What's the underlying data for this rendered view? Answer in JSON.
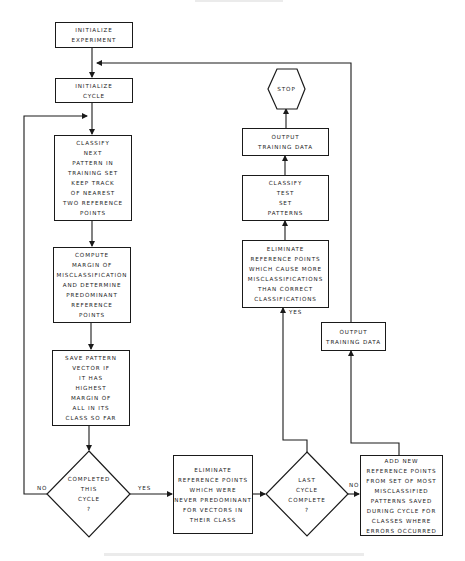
{
  "diagram": {
    "type": "flowchart",
    "header_text": "",
    "caption": "",
    "nodes": {
      "init_experiment": {
        "shape": "process",
        "lines": [
          "INITIALIZE",
          "EXPERIMENT"
        ]
      },
      "init_cycle": {
        "shape": "process",
        "lines": [
          "INITIALIZE",
          "CYCLE"
        ]
      },
      "classify_next": {
        "shape": "process",
        "lines": [
          "CLASSIFY",
          "NEXT",
          "PATTERN IN",
          "TRAINING SET",
          "KEEP TRACK",
          "OF NEAREST",
          "TWO REFERENCE",
          "POINTS"
        ]
      },
      "compute_margin": {
        "shape": "process",
        "lines": [
          "COMPUTE",
          "MARGIN OF",
          "MISCLASSIFICATION",
          "AND DETERMINE",
          "PREDOMINANT",
          "REFERENCE",
          "POINTS"
        ]
      },
      "save_pattern": {
        "shape": "process",
        "lines": [
          "SAVE PATTERN",
          "VECTOR IF",
          "IT HAS",
          "HIGHEST",
          "MARGIN OF",
          "ALL IN ITS",
          "CLASS SO FAR"
        ]
      },
      "completed_cycle": {
        "shape": "decision",
        "lines": [
          "COMPLETED",
          "THIS",
          "CYCLE",
          "?"
        ]
      },
      "eliminate_never_predominant": {
        "shape": "process",
        "lines": [
          "ELIMINATE",
          "REFERENCE POINTS",
          "WHICH WERE",
          "NEVER PREDOMINANT",
          "FOR VECTORS IN",
          "THEIR CLASS"
        ]
      },
      "last_cycle": {
        "shape": "decision",
        "lines": [
          "LAST",
          "CYCLE",
          "COMPLETE",
          "?"
        ]
      },
      "add_new_points": {
        "shape": "process",
        "lines": [
          "ADD NEW",
          "REFERENCE POINTS",
          "FROM SET OF MOST",
          "MISCLASSIFIED",
          "PATTERNS SAVED",
          "DURING CYCLE FOR",
          "CLASSES WHERE",
          "ERRORS OCCURRED"
        ]
      },
      "output_training_right": {
        "shape": "process",
        "lines": [
          "OUTPUT",
          "TRAINING DATA"
        ]
      },
      "eliminate_more_misclass": {
        "shape": "process",
        "lines": [
          "ELIMINATE",
          "REFERENCE POINTS",
          "WHICH CAUSE MORE",
          "MISCLASSIFICATIONS",
          "THAN CORRECT",
          "CLASSIFICATIONS"
        ]
      },
      "classify_test": {
        "shape": "process",
        "lines": [
          "CLASSIFY",
          "TEST",
          "SET",
          "PATTERNS"
        ]
      },
      "output_training_top": {
        "shape": "process",
        "lines": [
          "OUTPUT",
          "TRAINING DATA"
        ]
      },
      "stop": {
        "shape": "terminal-hexagon",
        "lines": [
          "STOP"
        ]
      }
    },
    "edge_labels": {
      "completed_no": "NO",
      "completed_yes": "YES",
      "last_yes": "YES",
      "last_no": "NO"
    },
    "edges": [
      {
        "from": "init_experiment",
        "to": "init_cycle"
      },
      {
        "from": "init_cycle",
        "to": "classify_next"
      },
      {
        "from": "classify_next",
        "to": "compute_margin"
      },
      {
        "from": "compute_margin",
        "to": "save_pattern"
      },
      {
        "from": "save_pattern",
        "to": "completed_cycle"
      },
      {
        "from": "completed_cycle",
        "to": "classify_next",
        "label": "NO"
      },
      {
        "from": "completed_cycle",
        "to": "eliminate_never_predominant",
        "label": "YES"
      },
      {
        "from": "eliminate_never_predominant",
        "to": "last_cycle"
      },
      {
        "from": "last_cycle",
        "to": "eliminate_more_misclass",
        "label": "YES"
      },
      {
        "from": "last_cycle",
        "to": "add_new_points",
        "label": "NO"
      },
      {
        "from": "add_new_points",
        "to": "output_training_right"
      },
      {
        "from": "output_training_right",
        "to": "init_cycle"
      },
      {
        "from": "eliminate_more_misclass",
        "to": "classify_test"
      },
      {
        "from": "classify_test",
        "to": "output_training_top"
      },
      {
        "from": "output_training_top",
        "to": "stop"
      }
    ],
    "colors": {
      "ink": "#1a1a1a",
      "paper": "#ffffff"
    }
  }
}
